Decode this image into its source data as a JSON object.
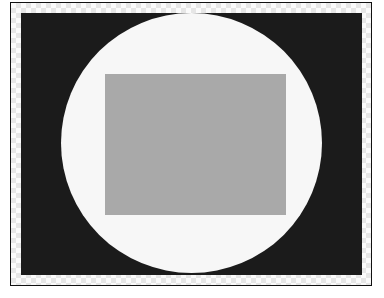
{
  "image": {
    "description": "Framed image: dark background, light circle, gray rectangle centered",
    "colors": {
      "frame_border": "#111111",
      "checker_light": "#fbfbfb",
      "checker_dark": "#e6e6e6",
      "background": "#1b1b1b",
      "circle": "#f7f7f7",
      "rectangle": "#a9a9a9"
    },
    "shapes": [
      {
        "type": "circle",
        "name": "white-circle"
      },
      {
        "type": "rectangle",
        "name": "gray-rectangle"
      }
    ]
  }
}
